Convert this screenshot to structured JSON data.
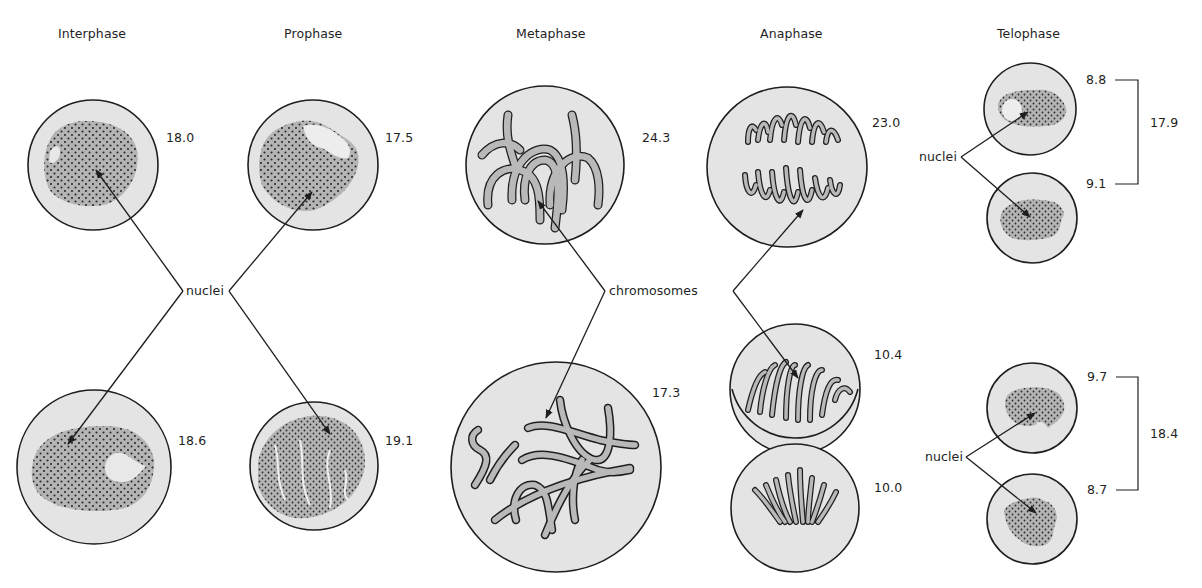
{
  "diagram": {
    "stages": [
      {
        "name": "Interphase",
        "cells": [
          {
            "position": "top",
            "value": "18.0"
          },
          {
            "position": "bottom",
            "value": "18.6"
          }
        ]
      },
      {
        "name": "Prophase",
        "cells": [
          {
            "position": "top",
            "value": "17.5"
          },
          {
            "position": "bottom",
            "value": "19.1"
          }
        ]
      },
      {
        "name": "Metaphase",
        "cells": [
          {
            "position": "top",
            "value": "24.3"
          },
          {
            "position": "bottom",
            "value": "17.3"
          }
        ]
      },
      {
        "name": "Anaphase",
        "cells": [
          {
            "position": "top",
            "value": "23.0"
          },
          {
            "position": "bottom-upper",
            "value": "10.4"
          },
          {
            "position": "bottom-lower",
            "value": "10.0"
          }
        ]
      },
      {
        "name": "Telophase",
        "pairs": [
          {
            "top_value": "8.8",
            "bottom_value": "9.1",
            "total": "17.9"
          },
          {
            "top_value": "9.7",
            "bottom_value": "8.7",
            "total": "18.4"
          }
        ]
      }
    ],
    "callouts": {
      "nuclei_left": "nuclei",
      "chromosomes": "chromosomes",
      "nuclei_telophase_top": "nuclei",
      "nuclei_telophase_bottom": "nuclei"
    },
    "colors": {
      "background": "#ffffff",
      "cell_fill": "#e4e4e4",
      "outline": "#1e1e1e",
      "nucleus_fill": "#b4b4b4",
      "chromosome_fill": "#b9b9b9",
      "dot": "#2a2a2a"
    }
  }
}
